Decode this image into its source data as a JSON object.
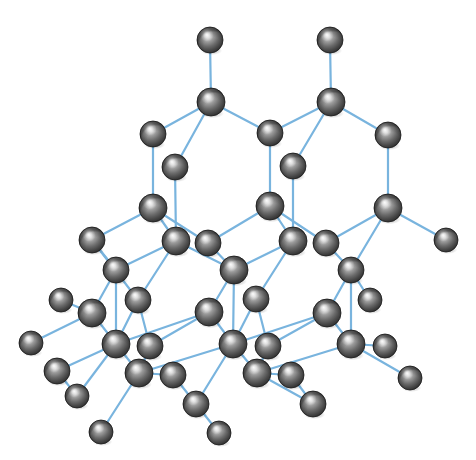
{
  "figure": {
    "background_color": "#ffffff",
    "atom_color_base": "#6e6e6e",
    "atom_color_highlight": "#e9e9e9",
    "atom_color_shadow": "#2b2b2b",
    "atom_outline_color": "#1c1c1c",
    "bond_color": "#79b4de",
    "bond_width": 2.2,
    "atom_radius": 13,
    "atom_count": 46,
    "bond_count": 62,
    "caption_text": ""
  },
  "chart_data": {
    "type": "scatter",
    "xlabel": "",
    "ylabel": "",
    "xlim": [
      0,
      476
    ],
    "ylim": [
      0,
      460
    ],
    "grid": false,
    "legend": "none",
    "atoms": [
      {
        "id": 0,
        "x": 210,
        "y": 40,
        "r": 13,
        "layer": "back"
      },
      {
        "id": 1,
        "x": 330,
        "y": 40,
        "r": 13,
        "layer": "back"
      },
      {
        "id": 2,
        "x": 211,
        "y": 102,
        "r": 14,
        "layer": "back"
      },
      {
        "id": 3,
        "x": 331,
        "y": 102,
        "r": 14,
        "layer": "back"
      },
      {
        "id": 4,
        "x": 153,
        "y": 134,
        "r": 13,
        "layer": "back"
      },
      {
        "id": 5,
        "x": 270,
        "y": 133,
        "r": 13,
        "layer": "back"
      },
      {
        "id": 6,
        "x": 388,
        "y": 135,
        "r": 13,
        "layer": "back"
      },
      {
        "id": 7,
        "x": 175,
        "y": 167,
        "r": 13,
        "layer": "mid"
      },
      {
        "id": 8,
        "x": 293,
        "y": 166,
        "r": 13,
        "layer": "mid"
      },
      {
        "id": 9,
        "x": 153,
        "y": 208,
        "r": 14,
        "layer": "back"
      },
      {
        "id": 10,
        "x": 270,
        "y": 206,
        "r": 14,
        "layer": "back"
      },
      {
        "id": 11,
        "x": 388,
        "y": 208,
        "r": 14,
        "layer": "back"
      },
      {
        "id": 12,
        "x": 446,
        "y": 240,
        "r": 12,
        "layer": "edge"
      },
      {
        "id": 13,
        "x": 92,
        "y": 240,
        "r": 13,
        "layer": "edge"
      },
      {
        "id": 14,
        "x": 176,
        "y": 241,
        "r": 14,
        "layer": "mid"
      },
      {
        "id": 15,
        "x": 208,
        "y": 243,
        "r": 13,
        "layer": "mid"
      },
      {
        "id": 16,
        "x": 293,
        "y": 241,
        "r": 14,
        "layer": "mid"
      },
      {
        "id": 17,
        "x": 326,
        "y": 243,
        "r": 13,
        "layer": "mid"
      },
      {
        "id": 18,
        "x": 116,
        "y": 270,
        "r": 13,
        "layer": "front"
      },
      {
        "id": 19,
        "x": 234,
        "y": 270,
        "r": 14,
        "layer": "front"
      },
      {
        "id": 20,
        "x": 351,
        "y": 270,
        "r": 13,
        "layer": "front"
      },
      {
        "id": 21,
        "x": 138,
        "y": 300,
        "r": 13,
        "layer": "mid"
      },
      {
        "id": 22,
        "x": 256,
        "y": 299,
        "r": 13,
        "layer": "mid"
      },
      {
        "id": 23,
        "x": 92,
        "y": 313,
        "r": 14,
        "layer": "front"
      },
      {
        "id": 24,
        "x": 209,
        "y": 312,
        "r": 14,
        "layer": "front"
      },
      {
        "id": 25,
        "x": 327,
        "y": 313,
        "r": 14,
        "layer": "front"
      },
      {
        "id": 26,
        "x": 31,
        "y": 343,
        "r": 12,
        "layer": "edge"
      },
      {
        "id": 27,
        "x": 116,
        "y": 344,
        "r": 14,
        "layer": "front"
      },
      {
        "id": 28,
        "x": 150,
        "y": 346,
        "r": 13,
        "layer": "front"
      },
      {
        "id": 29,
        "x": 233,
        "y": 344,
        "r": 14,
        "layer": "front"
      },
      {
        "id": 30,
        "x": 268,
        "y": 346,
        "r": 13,
        "layer": "front"
      },
      {
        "id": 31,
        "x": 351,
        "y": 344,
        "r": 14,
        "layer": "front"
      },
      {
        "id": 32,
        "x": 385,
        "y": 346,
        "r": 12,
        "layer": "edge"
      },
      {
        "id": 33,
        "x": 57,
        "y": 371,
        "r": 13,
        "layer": "front"
      },
      {
        "id": 34,
        "x": 139,
        "y": 373,
        "r": 14,
        "layer": "front"
      },
      {
        "id": 35,
        "x": 173,
        "y": 375,
        "r": 13,
        "layer": "front"
      },
      {
        "id": 36,
        "x": 257,
        "y": 373,
        "r": 14,
        "layer": "front"
      },
      {
        "id": 37,
        "x": 291,
        "y": 375,
        "r": 13,
        "layer": "front"
      },
      {
        "id": 38,
        "x": 410,
        "y": 378,
        "r": 12,
        "layer": "edge"
      },
      {
        "id": 39,
        "x": 77,
        "y": 396,
        "r": 12,
        "layer": "edge"
      },
      {
        "id": 40,
        "x": 196,
        "y": 404,
        "r": 13,
        "layer": "front"
      },
      {
        "id": 41,
        "x": 313,
        "y": 404,
        "r": 13,
        "layer": "front"
      },
      {
        "id": 42,
        "x": 101,
        "y": 432,
        "r": 12,
        "layer": "edge"
      },
      {
        "id": 43,
        "x": 219,
        "y": 433,
        "r": 12,
        "layer": "edge"
      },
      {
        "id": 44,
        "x": 370,
        "y": 300,
        "r": 12,
        "layer": "edge"
      },
      {
        "id": 45,
        "x": 61,
        "y": 300,
        "r": 12,
        "layer": "edge"
      }
    ],
    "bonds": [
      [
        0,
        2
      ],
      [
        1,
        3
      ],
      [
        2,
        4
      ],
      [
        2,
        5
      ],
      [
        2,
        7
      ],
      [
        3,
        5
      ],
      [
        3,
        6
      ],
      [
        3,
        8
      ],
      [
        4,
        9
      ],
      [
        6,
        11
      ],
      [
        7,
        14
      ],
      [
        8,
        16
      ],
      [
        5,
        10
      ],
      [
        9,
        13
      ],
      [
        9,
        14
      ],
      [
        9,
        15
      ],
      [
        10,
        15
      ],
      [
        10,
        16
      ],
      [
        10,
        17
      ],
      [
        11,
        12
      ],
      [
        11,
        17
      ],
      [
        11,
        20
      ],
      [
        13,
        18
      ],
      [
        13,
        21
      ],
      [
        14,
        18
      ],
      [
        14,
        19
      ],
      [
        14,
        21
      ],
      [
        15,
        19
      ],
      [
        16,
        19
      ],
      [
        16,
        22
      ],
      [
        17,
        20
      ],
      [
        18,
        23
      ],
      [
        18,
        27
      ],
      [
        19,
        24
      ],
      [
        19,
        29
      ],
      [
        20,
        25
      ],
      [
        20,
        31
      ],
      [
        20,
        44
      ],
      [
        21,
        27
      ],
      [
        21,
        28
      ],
      [
        22,
        29
      ],
      [
        22,
        30
      ],
      [
        23,
        26
      ],
      [
        23,
        27
      ],
      [
        23,
        45
      ],
      [
        24,
        27
      ],
      [
        24,
        28
      ],
      [
        24,
        29
      ],
      [
        25,
        29
      ],
      [
        25,
        30
      ],
      [
        25,
        31
      ],
      [
        27,
        33
      ],
      [
        27,
        34
      ],
      [
        27,
        39
      ],
      [
        29,
        34
      ],
      [
        29,
        36
      ],
      [
        29,
        40
      ],
      [
        31,
        32
      ],
      [
        31,
        36
      ],
      [
        31,
        38
      ],
      [
        34,
        35
      ],
      [
        34,
        42
      ],
      [
        36,
        37
      ],
      [
        36,
        41
      ],
      [
        33,
        39
      ],
      [
        35,
        40
      ],
      [
        37,
        41
      ],
      [
        40,
        43
      ],
      [
        28,
        34
      ],
      [
        30,
        36
      ]
    ],
    "notes": [
      "Each interior atom is bonded to four neighbours in a tetrahedral arrangement",
      "Light blue sticks represent covalent bonds",
      "Gray shaded spheres represent carbon (or silicon) atoms"
    ]
  }
}
